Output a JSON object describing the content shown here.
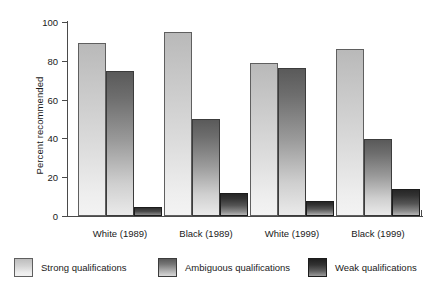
{
  "chart_data": {
    "type": "bar",
    "title": "",
    "subtitle": "",
    "xlabel": "",
    "ylabel": "Percent recommended",
    "ylim": [
      0,
      100
    ],
    "yticks": [
      0,
      20,
      40,
      60,
      80,
      100
    ],
    "grid": false,
    "legend_position": "bottom",
    "categories": [
      "White (1989)",
      "Black (1989)",
      "White (1999)",
      "Black (1999)"
    ],
    "series": [
      {
        "name": "Strong qualifications",
        "color": "#d2d2d2",
        "values": [
          89,
          95,
          79,
          86
        ]
      },
      {
        "name": "Ambiguous qualifications",
        "color": "#8a8a8a",
        "values": [
          75,
          50,
          76.5,
          39.5
        ]
      },
      {
        "name": "Weak qualifications",
        "color": "#333333",
        "values": [
          4.5,
          12,
          7.5,
          14
        ]
      }
    ]
  },
  "axis": {
    "y_label": "Percent recommended",
    "tick_labels": [
      "100",
      "80",
      "60",
      "40",
      "20",
      "0"
    ]
  },
  "categories": {
    "c0": "White (1989)",
    "c1": "Black (1989)",
    "c2": "White (1999)",
    "c3": "Black (1999)"
  },
  "legend": {
    "items": [
      {
        "label": "Strong qualifications"
      },
      {
        "label": "Ambiguous qualifications"
      },
      {
        "label": "Weak qualifications"
      }
    ]
  }
}
